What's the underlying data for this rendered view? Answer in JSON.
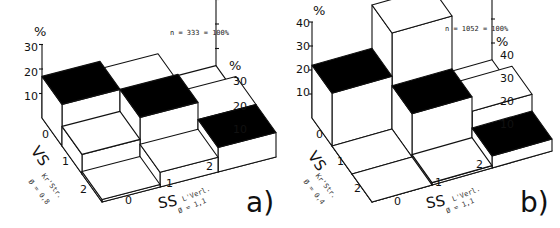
{
  "chart_data": [
    {
      "type": "bar",
      "subtype": "3d-bar-grid",
      "panel_label": "a)",
      "sample_note": "n = 333 = 100%",
      "xlabel": "SS",
      "xlabel_sub": "L'Verl.",
      "xlabel_phi": "Ø = 1,1",
      "ylabel": "VS",
      "ylabel_sub": "Kr'Str.",
      "ylabel_phi": "Ø = 0,8",
      "zlabel": "%",
      "x_categories": [
        "0",
        "1",
        "2"
      ],
      "y_categories": [
        "0",
        "1",
        "2"
      ],
      "z_ticks_left": [
        "10",
        "20",
        "30"
      ],
      "z_ticks_right": [
        "10",
        "20",
        "30"
      ],
      "zlim": [
        0,
        30
      ],
      "highlight": "black top = diagonal cells (VS = SS)",
      "values": [
        {
          "vs": "0",
          "ss": "0",
          "value": 17,
          "highlight": true
        },
        {
          "vs": "0",
          "ss": "1",
          "value": 14,
          "highlight": false
        },
        {
          "vs": "0",
          "ss": "2",
          "value": 3,
          "highlight": false
        },
        {
          "vs": "1",
          "ss": "0",
          "value": 8,
          "highlight": false
        },
        {
          "vs": "1",
          "ss": "1",
          "value": 17,
          "highlight": true
        },
        {
          "vs": "1",
          "ss": "2",
          "value": 10,
          "highlight": false
        },
        {
          "vs": "2",
          "ss": "0",
          "value": 1,
          "highlight": false
        },
        {
          "vs": "2",
          "ss": "1",
          "value": 6,
          "highlight": false
        },
        {
          "vs": "2",
          "ss": "2",
          "value": 10,
          "highlight": true
        }
      ]
    },
    {
      "type": "bar",
      "subtype": "3d-bar-grid",
      "panel_label": "b)",
      "sample_note": "n = 1052 = 100%",
      "xlabel": "SS",
      "xlabel_sub": "L'Verl.",
      "xlabel_phi": "Ø = 1,1",
      "ylabel": "VS",
      "ylabel_sub": "Kr'Str.",
      "ylabel_phi": "Ø = 0,4",
      "zlabel": "%",
      "x_categories": [
        "0",
        "1",
        "2"
      ],
      "y_categories": [
        "0",
        "1",
        "2"
      ],
      "z_ticks_left": [
        "10",
        "20",
        "30",
        "40"
      ],
      "z_ticks_right": [
        "10",
        "20",
        "30",
        "40"
      ],
      "zlim": [
        0,
        40
      ],
      "highlight": "black top = diagonal cells (VS = SS)",
      "values": [
        {
          "vs": "0",
          "ss": "0",
          "value": 22,
          "highlight": true
        },
        {
          "vs": "0",
          "ss": "1",
          "value": 40,
          "highlight": false
        },
        {
          "vs": "0",
          "ss": "2",
          "value": 3,
          "highlight": false
        },
        {
          "vs": "1",
          "ss": "0",
          "value": 0,
          "highlight": false
        },
        {
          "vs": "1",
          "ss": "1",
          "value": 18,
          "highlight": true
        },
        {
          "vs": "1",
          "ss": "2",
          "value": 12,
          "highlight": false
        },
        {
          "vs": "2",
          "ss": "0",
          "value": 0,
          "highlight": false
        },
        {
          "vs": "2",
          "ss": "1",
          "value": 1,
          "highlight": false
        },
        {
          "vs": "2",
          "ss": "2",
          "value": 5,
          "highlight": true
        }
      ]
    }
  ],
  "panels": {
    "a": {
      "label": "a)",
      "n_text": "n = 333 = 100%",
      "pct": "%",
      "ticks_left": [
        "30",
        "20",
        "10"
      ],
      "ticks_right": [
        "30",
        "20",
        "10"
      ],
      "vs": "VS",
      "vs_sub": "Kr'Str.",
      "vs_phi": "Ø = 0,8",
      "ss": "SS",
      "ss_sub": "L'Verl.",
      "ss_phi": "Ø = 1,1",
      "row_labels": [
        "0",
        "1",
        "2"
      ],
      "col_labels": [
        "0",
        "1",
        "2"
      ]
    },
    "b": {
      "label": "b)",
      "n_text": "n = 1052 = 100%",
      "pct": "%",
      "ticks_left": [
        "40",
        "30",
        "20",
        "10"
      ],
      "ticks_right": [
        "40",
        "30",
        "20",
        "10"
      ],
      "vs": "VS",
      "vs_sub": "Kr'Str.",
      "vs_phi": "Ø = 0,4",
      "ss": "SS",
      "ss_sub": "L'Verl.",
      "ss_phi": "Ø = 1,1",
      "row_labels": [
        "0",
        "1",
        "2"
      ],
      "col_labels": [
        "0",
        "1",
        "2"
      ]
    }
  }
}
